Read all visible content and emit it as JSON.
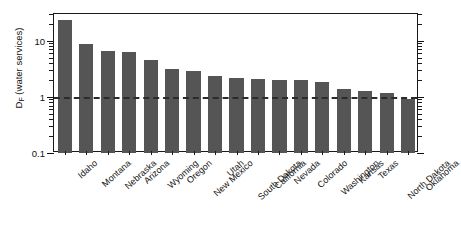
{
  "chart_data": {
    "type": "bar",
    "title": "",
    "xlabel": "",
    "ylabel": "D_F (water services)",
    "ylabel_base": "D",
    "ylabel_sub": "F",
    "ylabel_rest": " (water services)",
    "yscale": "log",
    "ylim": [
      0.1,
      30
    ],
    "ytick_labels": [
      "10",
      "1",
      "0.1"
    ],
    "ytick_values": [
      10,
      1,
      0.1
    ],
    "grid": false,
    "legend": null,
    "reference_line": {
      "value": 1.0,
      "style": "dashed",
      "color": "#2b2b2b"
    },
    "bar_color": "#555555",
    "categories": [
      "Idaho",
      "Montana",
      "Nebraska",
      "Arizona",
      "Wyoming",
      "Oregon",
      "New Mexico",
      "Utah",
      "South Dakota",
      "California",
      "Nevada",
      "Colorado",
      "Washington",
      "Kansas",
      "Texas",
      "North Dakota",
      "Oklahoma"
    ],
    "values": [
      23.0,
      8.6,
      6.7,
      6.2,
      4.6,
      3.2,
      2.9,
      2.35,
      2.2,
      2.05,
      2.0,
      2.0,
      1.85,
      1.4,
      1.25,
      1.15,
      0.92
    ]
  }
}
